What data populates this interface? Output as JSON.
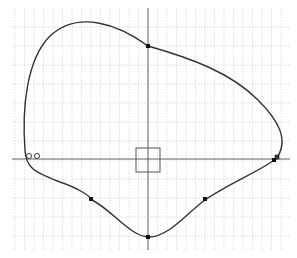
{
  "canvas": {
    "width": 297,
    "height": 258,
    "background": "#ffffff"
  },
  "grid": {
    "x_start": 15,
    "x_end": 290,
    "x_step": 9.5,
    "y_start": 8,
    "y_end": 250,
    "y_step": 19,
    "color": "#c8c8c8"
  },
  "axes": {
    "x_axis": {
      "y": 159,
      "x1": 12,
      "x2": 290,
      "color": "#555555"
    },
    "y_axis": {
      "x": 148,
      "y1": 8,
      "y2": 250,
      "color": "#555555"
    }
  },
  "curve": {
    "color": "#333333",
    "path": "M 148 46 C 118 24, 78 10, 50 36 C 26 60, 22 110, 25 150 C 26 168, 34 172, 60 182 C 78 188, 90 196, 92 200 C 112 210, 130 236, 148 237 C 168 238, 188 212, 205 200 C 228 184, 258 172, 276 159 C 290 140, 278 120, 258 100 C 230 72, 190 58, 148 46 Z"
  },
  "control_points": [
    {
      "name": "top-point",
      "x": 148,
      "y": 46
    },
    {
      "name": "bottom-point",
      "x": 148,
      "y": 237
    },
    {
      "name": "lower-left-point",
      "x": 91,
      "y": 199
    },
    {
      "name": "lower-right-point",
      "x": 205,
      "y": 199
    },
    {
      "name": "right-point",
      "x": 274,
      "y": 160
    }
  ],
  "handle_marker": {
    "x": 277,
    "y": 157,
    "size": 4
  },
  "open_circles": [
    {
      "x": 29,
      "y": 156,
      "r": 2.5
    },
    {
      "x": 37,
      "y": 156,
      "r": 2.5
    }
  ],
  "selection_box": {
    "x": 136,
    "y": 148,
    "width": 24,
    "height": 24,
    "color": "#555555"
  },
  "small_marks": [
    {
      "x": 148,
      "y": 123
    },
    {
      "x": 183,
      "y": 159
    }
  ]
}
